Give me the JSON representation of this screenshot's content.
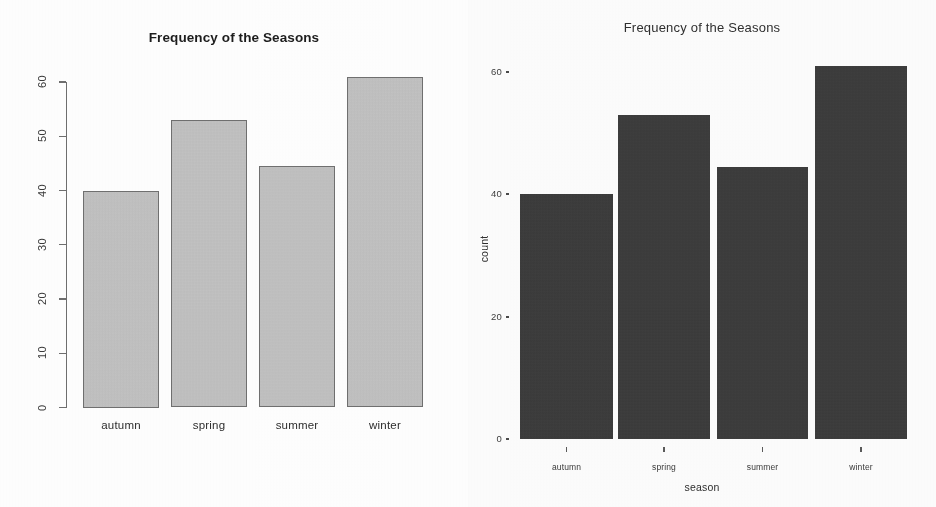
{
  "figure": {
    "panels": [
      {
        "id": "base-r-barplot",
        "title": "Frequency of the Seasons",
        "style": "base-r",
        "bar_fill": "#c6c6c6",
        "bar_border": "#707070"
      },
      {
        "id": "ggplot2-barplot",
        "title": "Frequency of the Seasons",
        "style": "ggplot2",
        "bar_fill": "#363636",
        "xlabel": "season",
        "ylabel": "count"
      }
    ]
  },
  "chart_data": [
    {
      "type": "bar",
      "id": "base-r-barplot",
      "title": "Frequency of the Seasons",
      "categories": [
        "autumn",
        "spring",
        "summer",
        "winter"
      ],
      "values": [
        40,
        53,
        44.5,
        61
      ],
      "xlabel": "",
      "ylabel": "",
      "ylim": [
        0,
        62
      ],
      "yticks": [
        0,
        10,
        20,
        30,
        40,
        50,
        60
      ],
      "ytick_labels": [
        "0",
        "10",
        "20",
        "30",
        "40",
        "50",
        "60"
      ],
      "grid": false,
      "legend": "none",
      "bar_color": "#c6c6c6",
      "bar_edge_color": "#707070"
    },
    {
      "type": "bar",
      "id": "ggplot2-barplot",
      "title": "Frequency of the Seasons",
      "categories": [
        "autumn",
        "spring",
        "summer",
        "winter"
      ],
      "values": [
        40,
        53,
        44.5,
        61
      ],
      "xlabel": "season",
      "ylabel": "count",
      "ylim": [
        0,
        62
      ],
      "yticks": [
        0,
        20,
        40,
        60
      ],
      "ytick_labels": [
        "0",
        "20",
        "40",
        "60"
      ],
      "grid": false,
      "legend": "none",
      "bar_color": "#363636"
    }
  ]
}
